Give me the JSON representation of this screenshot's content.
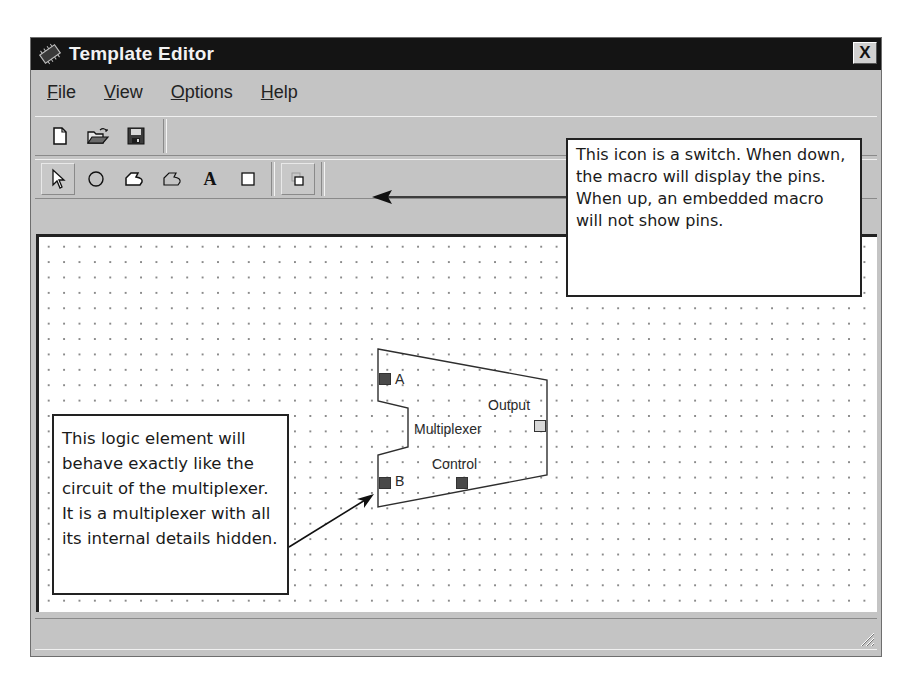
{
  "window": {
    "title": "Template Editor",
    "close_label": "X"
  },
  "menu": {
    "items": [
      {
        "label": "File",
        "mnemonic": "F",
        "rest": "ile"
      },
      {
        "label": "View",
        "mnemonic": "V",
        "rest": "iew"
      },
      {
        "label": "Options",
        "mnemonic": "O",
        "rest": "ptions"
      },
      {
        "label": "Help",
        "mnemonic": "H",
        "rest": "elp"
      }
    ]
  },
  "toolbar_file": {
    "tools": [
      {
        "name": "new-document",
        "icon": "new-document-icon"
      },
      {
        "name": "open-folder",
        "icon": "open-folder-icon"
      },
      {
        "name": "save",
        "icon": "floppy-disk-icon"
      }
    ]
  },
  "toolbar_draw": {
    "tools": [
      {
        "name": "select",
        "icon": "arrow-cursor-icon",
        "pressed": true
      },
      {
        "name": "circle",
        "icon": "circle-icon"
      },
      {
        "name": "filled-polygon",
        "icon": "filled-polygon-icon"
      },
      {
        "name": "polygon",
        "icon": "polygon-outline-icon"
      },
      {
        "name": "text",
        "icon": "text-a-icon",
        "glyph": "A"
      },
      {
        "name": "rectangle",
        "icon": "rectangle-icon"
      },
      {
        "name": "show-pins-switch",
        "icon": "pins-toggle-icon",
        "pressed": true
      }
    ]
  },
  "canvas": {
    "element": {
      "name": "Multiplexer",
      "pins": {
        "input_a": "A",
        "input_b": "B",
        "output": "Output",
        "control": "Control"
      }
    }
  },
  "callouts": {
    "switch_note": "This icon is a switch. When down, the macro will display the pins. When up, an embedded macro will not show pins.",
    "element_note": "This logic element will behave exactly like the circuit of the multiplexer. It is a multiplexer with all its internal details hidden."
  },
  "colors": {
    "titlebar": "#141414",
    "chrome": "#c4c4c4",
    "canvas": "#ffffff",
    "pin_input": "#4a4a4a",
    "pin_output": "#d8d8d8"
  }
}
